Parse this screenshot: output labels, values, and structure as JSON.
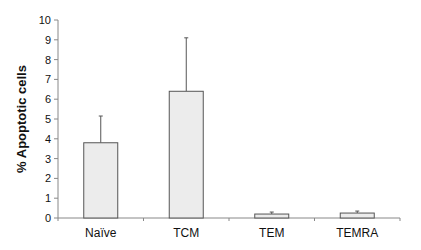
{
  "chart_data": {
    "type": "bar",
    "title": "",
    "xlabel": "",
    "ylabel": "% Apoptotic cells",
    "categories": [
      "Naïve",
      "TCM",
      "TEM",
      "TEMRA"
    ],
    "values": [
      3.8,
      6.4,
      0.2,
      0.25
    ],
    "error_upper": [
      5.15,
      9.1,
      0.3,
      0.35
    ],
    "ylim": [
      0,
      10
    ],
    "yticks": [
      0,
      1,
      2,
      3,
      4,
      5,
      6,
      7,
      8,
      9,
      10
    ],
    "grid": false,
    "legend": null,
    "bar_color": "#ececec",
    "edge_color": "#555555"
  }
}
